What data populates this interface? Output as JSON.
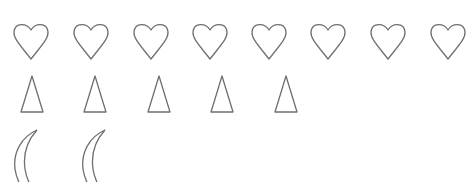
{
  "colors": {
    "stroke": "#6f6f6f",
    "background": "#ffffff"
  },
  "rows": [
    {
      "shape": "heart",
      "count": 8,
      "x": [
        13,
        73,
        133,
        192,
        251,
        310,
        370,
        430
      ],
      "y": 22
    },
    {
      "shape": "triangle",
      "count": 5,
      "x": [
        20,
        83,
        147,
        210,
        274
      ],
      "y": 75
    },
    {
      "shape": "crescent-moon",
      "count": 2,
      "x": [
        13,
        81
      ],
      "y": 129
    }
  ]
}
